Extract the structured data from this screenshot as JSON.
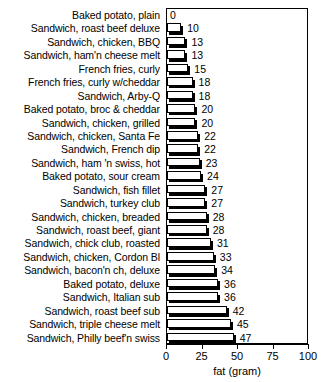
{
  "chart_data": {
    "type": "bar",
    "orientation": "horizontal",
    "title": "",
    "xlabel": "fat (gram)",
    "ylabel": "",
    "xlim": [
      0,
      100
    ],
    "xticks": [
      0,
      25,
      50,
      75,
      100
    ],
    "grid": false,
    "legend": null,
    "categories": [
      "Baked potato, plain",
      "Sandwich, roast beef deluxe",
      "Sandwich, chicken, BBQ",
      "Sandwich, ham'n cheese melt",
      "French fries, curly",
      "French fries, curly w/cheddar",
      "Sandwich, Arby-Q",
      "Baked potato, broc & cheddar",
      "Sandwich, chicken, grilled",
      "Sandwich, chicken, Santa Fe",
      "Sandwich, French dip",
      "Sandwich, ham 'n swiss, hot",
      "Baked potato, sour cream",
      "Sandwich, fish fillet",
      "Sandwich, turkey club",
      "Sandwich, chicken, breaded",
      "Sandwich, roast beef, giant",
      "Sandwich, chick club, roasted",
      "Sandwich, chicken, Cordon Bl",
      "Sandwich, bacon'n ch, deluxe",
      "Baked potato, deluxe",
      "Sandwich, Italian sub",
      "Sandwich, roast beef sub",
      "Sandwich, triple cheese melt",
      "Sandwich, Philly beef'n swiss"
    ],
    "values": [
      0,
      10,
      13,
      13,
      15,
      18,
      18,
      20,
      20,
      22,
      22,
      23,
      24,
      27,
      27,
      28,
      28,
      31,
      33,
      34,
      36,
      36,
      42,
      45,
      47
    ],
    "value_labels": [
      "0",
      "10",
      "13",
      "13",
      "15",
      "18",
      "18",
      "20",
      "20",
      "22",
      "22",
      "23",
      "24",
      "27",
      "27",
      "28",
      "28",
      "31",
      "33",
      "34",
      "36",
      "36",
      "42",
      "45",
      "47"
    ],
    "tick_labels": [
      "0",
      "25",
      "50",
      "75",
      "100"
    ],
    "colors": {
      "bar_fill": "#ffffff",
      "bar_outline": "#000000",
      "bar_shadow": "#000000",
      "axis": "#000000",
      "text": "#000000",
      "background": "#ffffff"
    }
  }
}
